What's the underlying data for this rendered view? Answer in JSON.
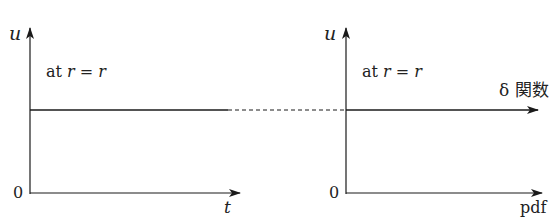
{
  "left_panel": {
    "y_axis_label": "u",
    "x_axis_label": "t",
    "origin_label": "0",
    "annotation_prefix": "at",
    "annotation_math": "r = r"
  },
  "right_panel": {
    "y_axis_label": "u",
    "x_axis_label": "pdf",
    "origin_label": "0",
    "annotation_prefix": "at",
    "annotation_math": "r = r",
    "line_label": "δ 関数"
  },
  "colors": {
    "line": "#1a1a1a",
    "background": "#ffffff"
  }
}
